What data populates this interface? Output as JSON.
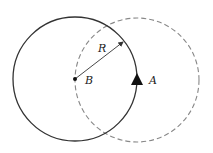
{
  "diagram": {
    "labels": {
      "radius": "R",
      "center": "B",
      "point": "A"
    },
    "solid_circle": {
      "cx": 75,
      "cy": 79,
      "r": 62,
      "stroke": "#333333",
      "style": "solid"
    },
    "dashed_circle": {
      "cx": 137,
      "cy": 80,
      "r": 62,
      "stroke": "#888888",
      "style": "dashed"
    },
    "center_point": {
      "x": 75,
      "y": 79,
      "name": "B"
    },
    "triangle_point": {
      "x": 137,
      "y": 80,
      "name": "A"
    },
    "radius_arrow": {
      "x1": 75,
      "y1": 79,
      "x2": 124,
      "y2": 41
    }
  }
}
